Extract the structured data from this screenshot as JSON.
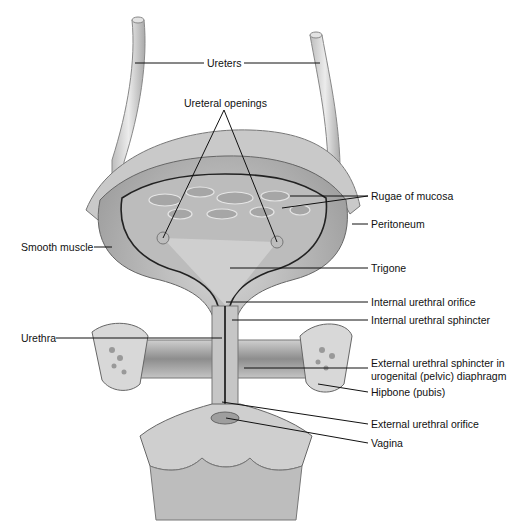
{
  "diagram": {
    "labels": {
      "ureters": "Ureters",
      "ureteral_openings": "Ureteral openings",
      "rugae": "Rugae of mucosa",
      "peritoneum": "Peritoneum",
      "smooth_muscle": "Smooth muscle",
      "trigone": "Trigone",
      "internal_orifice": "Internal urethral orifice",
      "internal_sphincter": "Internal urethral sphincter",
      "urethra": "Urethra",
      "external_sphincter_line1": "External urethral sphincter in",
      "external_sphincter_line2": "urogenital (pelvic) diaphragm",
      "hipbone": "Hipbone (pubis)",
      "external_orifice": "External urethral orifice",
      "vagina": "Vagina"
    },
    "colors": {
      "tissue_light": "#d9d9d9",
      "tissue_mid": "#b5b5b5",
      "tissue_dark": "#8a8a8a",
      "outline": "#555555",
      "leader": "#111111"
    }
  }
}
